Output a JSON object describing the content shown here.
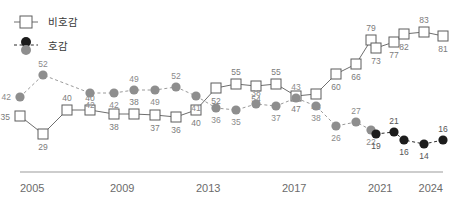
{
  "legend": {
    "position": "top-left",
    "items": [
      {
        "label": "비호감",
        "marker": "open-square",
        "line": "solid",
        "color": "#5d5d5d"
      },
      {
        "label": "호감",
        "marker": "filled-circle",
        "line": "dashed",
        "color": "#1c1c1c"
      }
    ]
  },
  "axis": {
    "ticks": [
      "2005",
      "2009",
      "2013",
      "2017",
      "2021",
      "2024"
    ],
    "tick_x": [
      20,
      110,
      196,
      282,
      368,
      443
    ],
    "line_from": 20,
    "line_to": 443
  },
  "chart_data": {
    "type": "line",
    "title": "",
    "xlabel": "",
    "ylabel": "",
    "xlim": [
      2005,
      2024
    ],
    "ylim": [
      0,
      100
    ],
    "grid": false,
    "legend_position": "top-left",
    "x_tick_labels": [
      "2005",
      "2009",
      "2013",
      "2017",
      "2021",
      "2024"
    ],
    "series": [
      {
        "name": "비호감",
        "marker": "open-square",
        "line": "solid",
        "color": "#5d5d5d",
        "values": [
          35,
          29,
          40,
          40,
          38,
          38,
          37,
          36,
          40,
          52,
          55,
          54,
          55,
          47,
          48,
          60,
          66,
          79,
          73,
          77,
          82,
          83,
          81
        ],
        "px": [
          20,
          43,
          67,
          90,
          114,
          134,
          155,
          176,
          196,
          216,
          236,
          256,
          276,
          296,
          316,
          336,
          356,
          371,
          376,
          394,
          404,
          424,
          443
        ],
        "py": [
          116,
          134,
          110,
          110,
          114,
          114,
          115,
          117,
          110,
          88,
          84,
          86,
          84,
          96,
          94,
          74,
          64,
          40,
          48,
          42,
          34,
          32,
          36
        ]
      },
      {
        "name": "호감",
        "segment": "early",
        "marker": "filled-circle",
        "line": "dashed",
        "color": "#8e8e8e",
        "values": [
          42,
          52,
          42,
          42,
          49,
          49,
          52,
          41,
          36,
          35,
          38,
          37,
          43,
          38,
          26,
          27,
          22
        ],
        "px": [
          20,
          43,
          90,
          114,
          134,
          155,
          176,
          196,
          216,
          236,
          256,
          276,
          296,
          316,
          336,
          356,
          371
        ],
        "py": [
          97,
          75,
          93,
          93,
          90,
          90,
          87,
          96,
          108,
          110,
          104,
          106,
          98,
          106,
          126,
          122,
          130
        ]
      },
      {
        "name": "호감",
        "segment": "late",
        "marker": "filled-circle",
        "line": "dashed",
        "color": "#1c1c1c",
        "values": [
          19,
          21,
          16,
          14,
          16
        ],
        "px": [
          376,
          394,
          404,
          424,
          443
        ],
        "py": [
          134,
          132,
          140,
          144,
          140
        ]
      }
    ]
  }
}
